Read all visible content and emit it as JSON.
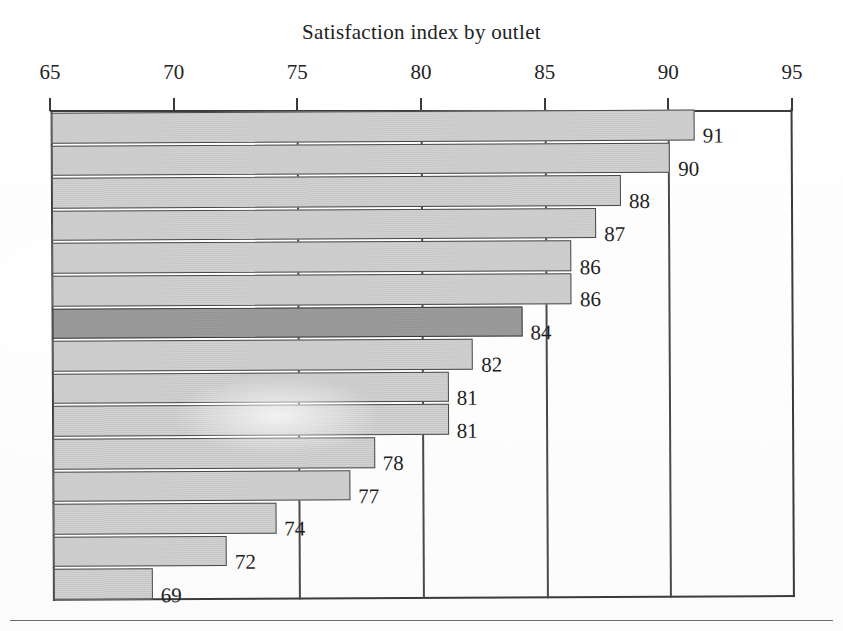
{
  "figure": {
    "title": "Satisfaction index by outlet",
    "footer_rule": true
  },
  "axis": {
    "labels": [
      "65",
      "70",
      "75",
      "80",
      "85",
      "90",
      "95"
    ]
  },
  "chart_data": {
    "type": "bar",
    "orientation": "horizontal",
    "title": "Satisfaction index by outlet",
    "xlabel": "",
    "ylabel": "",
    "xlim": [
      65,
      95
    ],
    "xticks": [
      65,
      70,
      75,
      80,
      85,
      90,
      95
    ],
    "grid": "vertical gridlines at 75, 80, 85, 90",
    "legend": "none",
    "categories": [
      "outlet-1",
      "outlet-2",
      "outlet-3",
      "outlet-4",
      "outlet-5",
      "outlet-6",
      "outlet-7",
      "outlet-8",
      "outlet-9",
      "outlet-10",
      "outlet-11",
      "outlet-12",
      "outlet-13",
      "outlet-14",
      "outlet-15"
    ],
    "values": [
      91,
      90,
      88,
      87,
      86,
      86,
      84,
      82,
      81,
      81,
      78,
      77,
      74,
      72,
      69
    ],
    "data_labels": [
      "91",
      "90",
      "88",
      "87",
      "86",
      "86",
      "84",
      "82",
      "81",
      "81",
      "78",
      "77",
      "74",
      "72",
      "69"
    ],
    "highlighted_index": 6,
    "highlighted_value": 84,
    "colors": {
      "bar_fill": "#d2d2d2",
      "bar_highlight_fill": "#9d9d9d",
      "bar_outline": "#4a4a4a",
      "axis": "#3b3b3b",
      "text": "#1f1f1f",
      "background": "#ffffff"
    }
  }
}
